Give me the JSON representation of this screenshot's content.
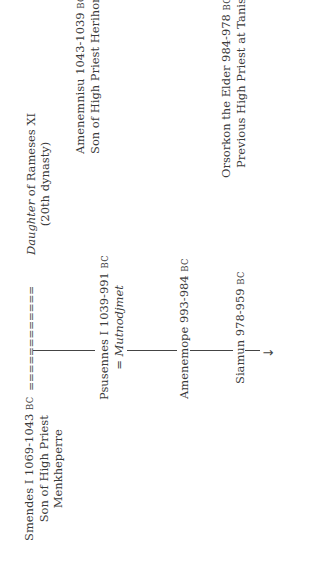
{
  "diagram": {
    "orientation": "rotated -90deg (text reads bottom-to-top)",
    "line_color": "#444444",
    "text_color": "#3a3a3a"
  },
  "nodes": {
    "smendes": {
      "name": "Smendes I 1069-1043",
      "era": "BC",
      "line2": "Son of High Priest",
      "line3": "Menkheperre"
    },
    "marriage_link": "============",
    "daughter": {
      "name_italic": "Daughter",
      "name_rest": " of Rameses XI",
      "line2": "(20th dynasty)"
    },
    "amenemnisu": {
      "name": "Amenemnisu 1043-1039",
      "era": "BC",
      "line2": "Son of High Priest Herihor"
    },
    "psusennes": {
      "name": "Psusennes I 1039-991",
      "era": "BC",
      "spouse_prefix": "= ",
      "spouse": "Mutnodjmet"
    },
    "amenemope": {
      "name": "Amenemope 993-984",
      "era": "BC"
    },
    "osorkon": {
      "name": "Orsorkon the Elder 984-978",
      "era": "BC",
      "line2": "Previous High Priest at Tanis"
    },
    "siamun": {
      "name": "Siamun 978-959",
      "era": "BC"
    },
    "continuation_arrow": "→"
  }
}
